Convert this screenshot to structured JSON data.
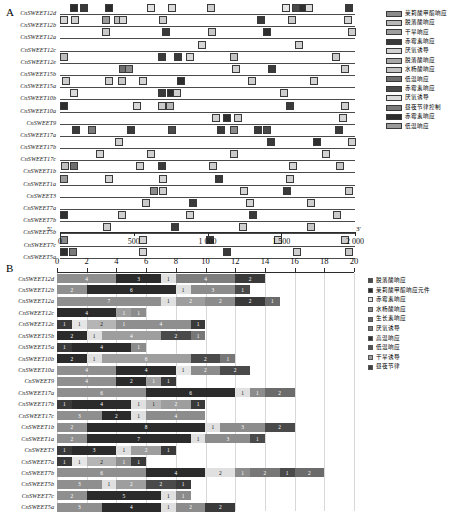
{
  "panel_a": {
    "letter": "A",
    "axis": {
      "label_5prime": "5'",
      "label_3prime": "3'",
      "ticks": [
        0,
        500,
        1000,
        1500,
        2000
      ],
      "tick_labels": [
        "0",
        "500",
        "1 000",
        "1 500",
        "2 000"
      ],
      "min": 0,
      "max": 2000
    },
    "genes": [
      "CnSWEET12d",
      "CnSWEET12b",
      "CnSWEET12a",
      "CnSWEET12c",
      "CnSWEET12e",
      "CnSWEET15b",
      "CnSWEET15a",
      "CnSWEET10b",
      "CnSWEET10a",
      "CnSWEET9",
      "CnSWEET17a",
      "CnSWEET17b",
      "CnSWEET17c",
      "CnSWEET1b",
      "CnSWEET1a",
      "CnSWEET3",
      "CnSWEET7a",
      "CnSWEET7b",
      "CnSWEET5b",
      "CnSWEET7c",
      "CnSWEET5a"
    ],
    "legend": [
      {
        "label": "茉莉酸甲酯响应",
        "color": "#8c8c8c"
      },
      {
        "label": "脱落酸响应",
        "color": "#b8b8b8"
      },
      {
        "label": "干旱响应",
        "color": "#9e9e9e"
      },
      {
        "label": "赤霉素响应",
        "color": "#3a3a3a"
      },
      {
        "label": "厌氧诱导",
        "color": "#d2d2d2"
      },
      {
        "label": "脱落酸响应",
        "color": "#a8a8a8"
      },
      {
        "label": "水杨酸响应",
        "color": "#c4c4c4"
      },
      {
        "label": "低温响应",
        "color": "#6e6e6e"
      },
      {
        "label": "赤霉素响应",
        "color": "#4a4a4a"
      },
      {
        "label": "厌氧诱导",
        "color": "#dcdcdc"
      },
      {
        "label": "昼夜节律控制",
        "color": "#7a7a7a"
      },
      {
        "label": "赤霉素响应",
        "color": "#2e2e2e"
      },
      {
        "label": "低温响应",
        "color": "#9a9a9a"
      }
    ],
    "motifs": [
      [
        [
          95,
          "#2b2b2b"
        ],
        [
          160,
          "#3a3a3a"
        ],
        [
          330,
          "#2b2b2b"
        ],
        [
          620,
          "#e2e2e2"
        ],
        [
          760,
          "#dcdcdc"
        ],
        [
          1025,
          "#cfcfcf"
        ],
        [
          1530,
          "#e6e6e6"
        ],
        [
          1600,
          "#4a4a4a"
        ],
        [
          1650,
          "#2e2e2e"
        ],
        [
          1690,
          "#dadada"
        ],
        [
          1960,
          "#3a3a3a"
        ]
      ],
      [
        [
          30,
          "#d6d6d6"
        ],
        [
          105,
          "#d0d0d0"
        ],
        [
          310,
          "#9a9a9a"
        ],
        [
          395,
          "#bdbdbd"
        ],
        [
          430,
          "#d8d8d8"
        ],
        [
          700,
          "#cdcdcd"
        ],
        [
          1360,
          "#3a3a3a"
        ],
        [
          1570,
          "#cbcbcb"
        ],
        [
          1950,
          "#d4d4d4"
        ]
      ],
      [
        [
          310,
          "#c9c9c9"
        ],
        [
          720,
          "#3a3a3a"
        ],
        [
          1030,
          "#c7c7c7"
        ],
        [
          1400,
          "#2e2e2e"
        ],
        [
          1980,
          "#cecece"
        ]
      ],
      [
        [
          960,
          "#d6d6d6"
        ],
        [
          1620,
          "#cfcfcf"
        ]
      ],
      [
        [
          25,
          "#bdbdbd"
        ],
        [
          690,
          "#3a3a3a"
        ],
        [
          800,
          "#3a3a3a"
        ],
        [
          880,
          "#d8d8d8"
        ],
        [
          1180,
          "#c4c4c4"
        ],
        [
          1870,
          "#cccccc"
        ]
      ],
      [
        [
          430,
          "#6e6e6e"
        ],
        [
          470,
          "#8a8a8a"
        ],
        [
          1190,
          "#d2d2d2"
        ],
        [
          1440,
          "#3a3a3a"
        ],
        [
          1930,
          "#cfcfcf"
        ]
      ],
      [
        [
          40,
          "#cdcdcd"
        ],
        [
          330,
          "#d0d0d0"
        ],
        [
          420,
          "#c8c8c8"
        ],
        [
          560,
          "#d4d4d4"
        ],
        [
          820,
          "#2e2e2e"
        ],
        [
          1300,
          "#cfcfcf"
        ],
        [
          1720,
          "#d2d2d2"
        ]
      ],
      [
        [
          95,
          "#dadada"
        ],
        [
          690,
          "#3a3a3a"
        ],
        [
          750,
          "#2e2e2e"
        ],
        [
          790,
          "#d0d0d0"
        ],
        [
          1520,
          "#cdcdcd"
        ]
      ],
      [
        [
          30,
          "#2e2e2e"
        ],
        [
          520,
          "#d8d8d8"
        ],
        [
          690,
          "#cacaca"
        ],
        [
          745,
          "#b5b5b5"
        ],
        [
          1560,
          "#3a3a3a"
        ],
        [
          1930,
          "#cfcfcf"
        ]
      ],
      [
        [
          1060,
          "#d2d2d2"
        ],
        [
          1130,
          "#2e2e2e"
        ],
        [
          1210,
          "#cfcfcf"
        ],
        [
          1920,
          "#d6d6d6"
        ]
      ],
      [
        [
          110,
          "#3a3a3a"
        ],
        [
          220,
          "#7a7a7a"
        ],
        [
          480,
          "#3a3a3a"
        ],
        [
          760,
          "#4a4a4a"
        ],
        [
          1090,
          "#3a3a3a"
        ],
        [
          1180,
          "#8a8a8a"
        ],
        [
          1340,
          "#3a3a3a"
        ],
        [
          1400,
          "#4a4a4a"
        ],
        [
          1890,
          "#3a3a3a"
        ]
      ],
      [
        [
          400,
          "#cfcfcf"
        ],
        [
          1430,
          "#3a3a3a"
        ],
        [
          1740,
          "#2e2e2e"
        ],
        [
          1980,
          "#d0d0d0"
        ]
      ],
      [
        [
          270,
          "#d4d4d4"
        ],
        [
          620,
          "#cfcfcf"
        ],
        [
          1180,
          "#c9c9c9"
        ],
        [
          1800,
          "#d2d2d2"
        ]
      ],
      [
        [
          35,
          "#bfbfbf"
        ],
        [
          95,
          "#6e6e6e"
        ],
        [
          540,
          "#d0d0d0"
        ],
        [
          690,
          "#3a3a3a"
        ],
        [
          1040,
          "#cccccc"
        ],
        [
          1580,
          "#d4d4d4"
        ],
        [
          1900,
          "#c6c6c6"
        ]
      ],
      [
        [
          30,
          "#9a9a9a"
        ],
        [
          330,
          "#d2d2d2"
        ],
        [
          700,
          "#d6d6d6"
        ],
        [
          1080,
          "#3a3a3a"
        ],
        [
          1560,
          "#cfcfcf"
        ]
      ],
      [
        [
          640,
          "#8a8a8a"
        ],
        [
          700,
          "#cdcdcd"
        ],
        [
          1250,
          "#d2d2d2"
        ],
        [
          1540,
          "#3a3a3a"
        ],
        [
          1960,
          "#cbcbcb"
        ]
      ],
      [
        [
          580,
          "#c9c9c9"
        ],
        [
          900,
          "#3a3a3a"
        ],
        [
          1290,
          "#d4d4d4"
        ],
        [
          1700,
          "#cfcfcf"
        ]
      ],
      [
        [
          25,
          "#2e2e2e"
        ],
        [
          420,
          "#cfcfcf"
        ],
        [
          880,
          "#d2d2d2"
        ],
        [
          1310,
          "#3a3a3a"
        ],
        [
          1880,
          "#cbcbcb"
        ]
      ],
      [
        [
          320,
          "#cdcdcd"
        ],
        [
          780,
          "#3a3a3a"
        ],
        [
          1240,
          "#d0d0d0"
        ],
        [
          1700,
          "#c7c7c7"
        ]
      ],
      [
        [
          30,
          "#8a8a8a"
        ],
        [
          560,
          "#d2d2d2"
        ],
        [
          1020,
          "#3a3a3a"
        ],
        [
          1480,
          "#cfcfcf"
        ],
        [
          1930,
          "#cacaca"
        ]
      ],
      [
        [
          25,
          "#2e2e2e"
        ],
        [
          90,
          "#7a7a7a"
        ],
        [
          560,
          "#d4d4d4"
        ],
        [
          1130,
          "#3a3a3a"
        ],
        [
          1610,
          "#cfcfcf"
        ],
        [
          1960,
          "#c9c9c9"
        ]
      ]
    ]
  },
  "panel_b": {
    "letter": "B",
    "legend": [
      {
        "label": "脱落酸响应",
        "color": "#4a4a4a"
      },
      {
        "label": "茉莉酸甲酯响应元件",
        "color": "#2b2b2b"
      },
      {
        "label": "赤霉素响应",
        "color": "#e0e0e0"
      },
      {
        "label": "水杨酸响应",
        "color": "#8c8c8c"
      },
      {
        "label": "生长素响应",
        "color": "#6b6b6b"
      },
      {
        "label": "厌氧诱导",
        "color": "#777777"
      },
      {
        "label": "高温响应",
        "color": "#333333"
      },
      {
        "label": "低温响应",
        "color": "#555555"
      },
      {
        "label": "干旱诱导",
        "color": "#9e9e9e"
      },
      {
        "label": "昼夜节律",
        "color": "#404040"
      }
    ],
    "axis": {
      "min": 0,
      "max": 20,
      "ticks": [
        0,
        2,
        4,
        6,
        8,
        10,
        12,
        14,
        16,
        18,
        20
      ],
      "tick_labels": [
        "0",
        "2",
        "4",
        "6",
        "8",
        "10",
        "12",
        "14",
        "16",
        "18",
        "20"
      ]
    },
    "genes": [
      "CnSWEET12d",
      "CnSWEET12b",
      "CnSWEET12a",
      "CnSWEET12c",
      "CnSWEET12e",
      "CnSWEET15b",
      "CnSWEET15a",
      "CnSWEET10b",
      "CnSWEET10a",
      "CnSWEET9",
      "CnSWEET17a",
      "CnSWEET17b",
      "CnSWEET17c",
      "CnSWEET1b",
      "CnSWEET1a",
      "CnSWEET3",
      "CnSWEET7a",
      "CnSWEET7b",
      "CnSWEET5b",
      "CnSWEET7c",
      "CnSWEET5a"
    ],
    "rows": [
      [
        [
          "4",
          "#8f8f8f"
        ],
        [
          "3",
          "#2b2b2b"
        ],
        [
          "1",
          "#e0e0e0"
        ],
        [
          "4",
          "#7e7e7e"
        ],
        [
          "2",
          "#3a3a3a"
        ]
      ],
      [
        [
          "2",
          "#8f8f8f"
        ],
        [
          "6",
          "#2b2b2b"
        ],
        [
          "1",
          "#e0e0e0"
        ],
        [
          "3",
          "#8c8c8c"
        ],
        [
          "1",
          "#4a4a4a"
        ]
      ],
      [
        [
          "7",
          "#8f8f8f"
        ],
        [
          "1",
          "#e0e0e0"
        ],
        [
          "2",
          "#9e9e9e"
        ],
        [
          "2",
          "#8c8c8c"
        ],
        [
          "2",
          "#3a3a3a"
        ],
        [
          "1",
          "#6b6b6b"
        ]
      ],
      [
        [
          "4",
          "#2b2b2b"
        ],
        [
          "1",
          "#9e9e9e"
        ],
        [
          "1",
          "#8c8c8c"
        ]
      ],
      [
        [
          "1",
          "#3a3a3a"
        ],
        [
          "1",
          "#e6e6e6"
        ],
        [
          "2",
          "#b5b5b5"
        ],
        [
          "1",
          "#8f8f8f"
        ],
        [
          "4",
          "#8f8f8f"
        ],
        [
          "1",
          "#3a3a3a"
        ]
      ],
      [
        [
          "2",
          "#2b2b2b"
        ],
        [
          "1",
          "#e0e0e0"
        ],
        [
          "4",
          "#9e9e9e"
        ],
        [
          "2",
          "#4a4a4a"
        ],
        [
          "1",
          "#777777"
        ]
      ],
      [
        [
          "1",
          "#3a3a3a"
        ],
        [
          "4",
          "#2b2b2b"
        ],
        [
          "1",
          "#8c8c8c"
        ]
      ],
      [
        [
          "2",
          "#2b2b2b"
        ],
        [
          "1",
          "#e0e0e0"
        ],
        [
          "6",
          "#9e9e9e"
        ],
        [
          "2",
          "#4a4a4a"
        ],
        [
          "1",
          "#777777"
        ]
      ],
      [
        [
          "4",
          "#8f8f8f"
        ],
        [
          "4",
          "#2b2b2b"
        ],
        [
          "1",
          "#e6e6e6"
        ],
        [
          "2",
          "#8c8c8c"
        ],
        [
          "2",
          "#4a4a4a"
        ]
      ],
      [
        [
          "4",
          "#8f8f8f"
        ],
        [
          "2",
          "#2b2b2b"
        ],
        [
          "1",
          "#9e9e9e"
        ],
        [
          "1",
          "#3a3a3a"
        ]
      ],
      [
        [
          "6",
          "#8f8f8f"
        ],
        [
          "6",
          "#2b2b2b"
        ],
        [
          "1",
          "#e0e0e0"
        ],
        [
          "1",
          "#8c8c8c"
        ],
        [
          "2",
          "#6b6b6b"
        ]
      ],
      [
        [
          "1",
          "#3a3a3a"
        ],
        [
          "4",
          "#2b2b2b"
        ],
        [
          "1",
          "#e0e0e0"
        ],
        [
          "1",
          "#b5b5b5"
        ],
        [
          "2",
          "#9e9e9e"
        ],
        [
          "1",
          "#3a3a3a"
        ]
      ],
      [
        [
          "3",
          "#8f8f8f"
        ],
        [
          "2",
          "#2b2b2b"
        ],
        [
          "1",
          "#e0e0e0"
        ],
        [
          "4",
          "#8c8c8c"
        ]
      ],
      [
        [
          "2",
          "#8f8f8f"
        ],
        [
          "8",
          "#2b2b2b"
        ],
        [
          "1",
          "#e0e0e0"
        ],
        [
          "3",
          "#8c8c8c"
        ],
        [
          "2",
          "#4a4a4a"
        ]
      ],
      [
        [
          "2",
          "#8f8f8f"
        ],
        [
          "7",
          "#2b2b2b"
        ],
        [
          "1",
          "#e0e0e0"
        ],
        [
          "3",
          "#8c8c8c"
        ],
        [
          "1",
          "#4a4a4a"
        ]
      ],
      [
        [
          "1",
          "#3a3a3a"
        ],
        [
          "3",
          "#2b2b2b"
        ],
        [
          "1",
          "#e0e0e0"
        ],
        [
          "2",
          "#9e9e9e"
        ],
        [
          "1",
          "#3a3a3a"
        ]
      ],
      [
        [
          "1",
          "#3a3a3a"
        ],
        [
          "1",
          "#e6e6e6"
        ],
        [
          "2",
          "#b5b5b5"
        ],
        [
          "1",
          "#8f8f8f"
        ],
        [
          "1",
          "#3a3a3a"
        ]
      ],
      [
        [
          "6",
          "#8f8f8f"
        ],
        [
          "4",
          "#2b2b2b"
        ],
        [
          "2",
          "#e0e0e0"
        ],
        [
          "1",
          "#8c8c8c"
        ],
        [
          "2",
          "#777777"
        ],
        [
          "1",
          "#4a4a4a"
        ],
        [
          "2",
          "#6b6b6b"
        ]
      ],
      [
        [
          "3",
          "#8f8f8f"
        ],
        [
          "1",
          "#e0e0e0"
        ],
        [
          "2",
          "#9e9e9e"
        ],
        [
          "2",
          "#4a4a4a"
        ],
        [
          "1",
          "#3a3a3a"
        ]
      ],
      [
        [
          "2",
          "#8f8f8f"
        ],
        [
          "5",
          "#2b2b2b"
        ],
        [
          "1",
          "#e0e0e0"
        ],
        [
          "1",
          "#8c8c8c"
        ]
      ],
      [
        [
          "3",
          "#8f8f8f"
        ],
        [
          "4",
          "#2b2b2b"
        ],
        [
          "1",
          "#e0e0e0"
        ],
        [
          "2",
          "#8c8c8c"
        ],
        [
          "2",
          "#3a3a3a"
        ]
      ]
    ]
  }
}
